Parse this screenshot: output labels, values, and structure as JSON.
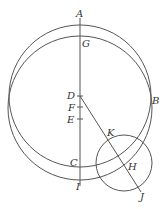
{
  "diagram": {
    "type": "geometry",
    "colors": {
      "line": "#555555",
      "label": "#333333",
      "background": "#ffffff"
    },
    "circles": [
      {
        "id": "circle-ABC",
        "cx": 80,
        "cy": 96,
        "r": 71
      },
      {
        "id": "circle-GI",
        "cx": 80,
        "cy": 108,
        "r": 72
      },
      {
        "id": "circle-H",
        "cx": 124,
        "cy": 163,
        "r": 28
      }
    ],
    "lines": [
      {
        "id": "line-AI",
        "x1": 80,
        "y1": 18,
        "x2": 80,
        "y2": 186
      },
      {
        "id": "line-DJ",
        "x1": 80,
        "y1": 96,
        "x2": 141,
        "y2": 192
      }
    ],
    "ticks": [
      {
        "id": "tick-D",
        "x": 80,
        "y": 96
      },
      {
        "id": "tick-F",
        "x": 80,
        "y": 107
      },
      {
        "id": "tick-E",
        "x": 80,
        "y": 119
      }
    ],
    "labels": {
      "A": "A",
      "G": "G",
      "D": "D",
      "F": "F",
      "E": "E",
      "B": "B",
      "C": "C",
      "I": "I",
      "K": "K",
      "H": "H",
      "J": "J"
    }
  }
}
